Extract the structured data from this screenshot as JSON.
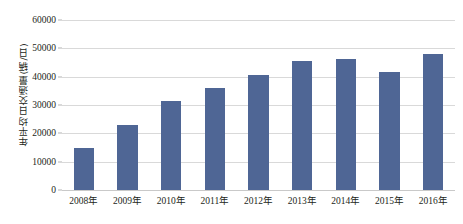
{
  "chart_data": {
    "type": "bar",
    "title": "",
    "subtitle": "",
    "xlabel": "",
    "ylabel": "年平均日交通量(辆/日)",
    "categories": [
      "2008年",
      "2009年",
      "2010年",
      "2011年",
      "2012年",
      "2013年",
      "2014年",
      "2015年",
      "2016年"
    ],
    "values": [
      15000,
      23000,
      31500,
      36000,
      40700,
      45700,
      46200,
      41600,
      48000
    ],
    "ylim": [
      0,
      60000
    ],
    "yticks": [
      0,
      10000,
      20000,
      30000,
      40000,
      50000,
      60000
    ],
    "ytick_labels": [
      "0",
      "10000",
      "20000",
      "30000",
      "40000",
      "50000",
      "60000"
    ],
    "grid": true,
    "legend": false,
    "legend_position": "none",
    "series": [
      {
        "name": "年平均日交通量",
        "color": "#4f6695",
        "values": [
          15000,
          23000,
          31500,
          36000,
          40700,
          45700,
          46200,
          41600,
          48000
        ]
      }
    ]
  },
  "colors": {
    "bar": "#4f6695",
    "gridline": "#d9d9d9",
    "baseline": "#c9c9c9",
    "text": "#231f20",
    "background": "#ffffff"
  }
}
